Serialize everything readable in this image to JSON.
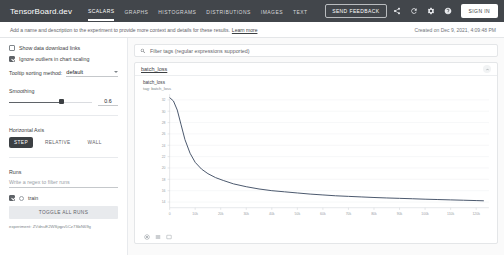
{
  "appbar": {
    "brand": "TensorBoard.dev",
    "tabs": [
      {
        "label": "SCALARS",
        "active": true
      },
      {
        "label": "GRAPHS",
        "active": false
      },
      {
        "label": "HISTOGRAMS",
        "active": false
      },
      {
        "label": "DISTRIBUTIONS",
        "active": false
      },
      {
        "label": "IMAGES",
        "active": false
      },
      {
        "label": "TEXT",
        "active": false
      }
    ],
    "feedback_label": "SEND FEEDBACK",
    "share_icon": "share-icon",
    "refresh_icon": "refresh-icon",
    "settings_icon": "gear-icon",
    "help_icon": "help-icon",
    "signin_label": "SIGN IN"
  },
  "description": {
    "text": "Add a name and description to the experiment to provide more context and details for these results.",
    "learn_more": "Learn more",
    "created": "Created on Dec 9, 2021, 4:09:48 PM"
  },
  "sidebar": {
    "show_download_links": "Show data download links",
    "ignore_outliers": "Ignore outliers in chart scaling",
    "tooltip_label": "Tooltip sorting method:",
    "tooltip_value": "default",
    "smoothing_label": "Smoothing",
    "smoothing_value": "0.6",
    "horizontal_axis_label": "Horizontal Axis",
    "axis_options": [
      {
        "label": "STEP",
        "active": true
      },
      {
        "label": "RELATIVE",
        "active": false
      },
      {
        "label": "WALL",
        "active": false
      }
    ],
    "runs_label": "Runs",
    "runs_filter_placeholder": "Write a regex to filter runs",
    "run_name": "train",
    "toggle_all_label": "TOGGLE ALL RUNS",
    "experiment_id": "experiment: ZVdnuE2WSjqpv5Cz7SbN69g"
  },
  "main": {
    "filter_placeholder": "Filter tags (regular expressions supported)",
    "search_icon": "search-icon",
    "card_title": "batch_loss",
    "collapse_icon": "chevron-up-icon",
    "tools": [
      "fit-domain-icon",
      "data-table-icon",
      "expand-icon"
    ]
  },
  "chart_data": {
    "type": "line",
    "title": "batch_loss",
    "subtitle": "tag: batch_loss",
    "xlabel": "",
    "ylabel": "",
    "xlim": [
      0,
      125000
    ],
    "ylim": [
      13,
      33
    ],
    "grid": true,
    "legend": false,
    "xticks": [
      0,
      10000,
      20000,
      30000,
      40000,
      50000,
      60000,
      70000,
      80000,
      90000,
      100000,
      110000,
      120000
    ],
    "xticklabels": [
      "0",
      "10k",
      "20k",
      "30k",
      "40k",
      "50k",
      "60k",
      "70k",
      "80k",
      "90k",
      "100k",
      "110k",
      "120k"
    ],
    "yticks": [
      14,
      16,
      18,
      20,
      22,
      24,
      26,
      28,
      30,
      32
    ],
    "yticklabels": [
      "14",
      "16",
      "18",
      "20",
      "22",
      "24",
      "26",
      "28",
      "30",
      "32"
    ],
    "series": [
      {
        "name": "train",
        "color": "#425066",
        "x": [
          0,
          1500,
          3000,
          4500,
          6000,
          8000,
          10000,
          12500,
          15000,
          18000,
          21000,
          25000,
          30000,
          35000,
          40000,
          45000,
          50000,
          55000,
          60000,
          65000,
          70000,
          75000,
          80000,
          85000,
          90000,
          95000,
          100000,
          105000,
          110000,
          115000,
          120000,
          123000
        ],
        "y": [
          32.4,
          31.8,
          30.2,
          27.6,
          25.0,
          22.6,
          21.0,
          19.8,
          19.0,
          18.3,
          17.8,
          17.2,
          16.7,
          16.3,
          16.0,
          15.8,
          15.6,
          15.4,
          15.25,
          15.1,
          15.0,
          14.9,
          14.8,
          14.72,
          14.65,
          14.58,
          14.5,
          14.44,
          14.38,
          14.32,
          14.26,
          14.22
        ]
      }
    ]
  }
}
